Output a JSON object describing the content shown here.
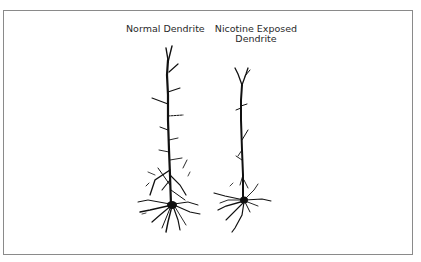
{
  "figure": {
    "labels": {
      "normal": "Normal Dendrite",
      "nicotine_line1": "Nicotine Exposed",
      "nicotine_line2": "Dendrite"
    },
    "colors": {
      "frame": "#8a8a8a",
      "ink": "#111111",
      "background": "#ffffff"
    }
  }
}
